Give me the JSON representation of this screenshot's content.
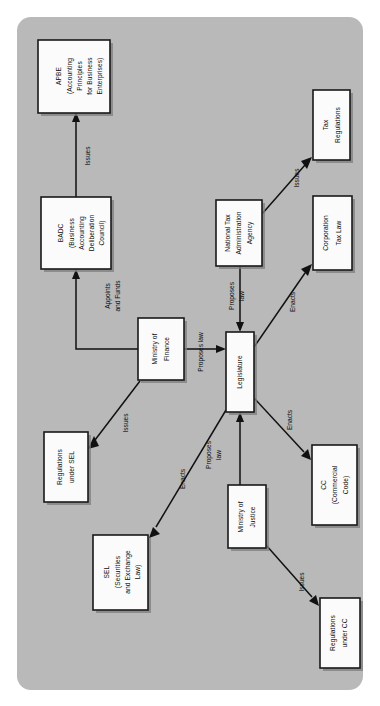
{
  "figure": {
    "kind": "flow-diagram",
    "orientation": "rotated-90-ccw",
    "panel_color": "#b9b9b9",
    "page_background": "#ffffff",
    "node_fill": "#fbfbfb",
    "node_stroke": "#1a1a1a",
    "edge_color": "#111111"
  },
  "nodes": [
    {
      "id": "apbe",
      "lines": [
        "APBE",
        "(Accounting",
        "Principles",
        "for Business",
        "Enterprises)"
      ],
      "x": 38,
      "y": 40,
      "w": 72,
      "h": 73
    },
    {
      "id": "badc",
      "lines": [
        "BADC",
        "(Business",
        "Accounting",
        "Deliberation",
        "Council)"
      ],
      "x": 41,
      "y": 197,
      "w": 70,
      "h": 72
    },
    {
      "id": "ministry-of-finance",
      "lines": [
        "Ministry of",
        "Finance"
      ],
      "x": 138,
      "y": 318,
      "w": 46,
      "h": 62
    },
    {
      "id": "regulations-under-sel",
      "lines": [
        "Regulations",
        "under SEL"
      ],
      "x": 44,
      "y": 432,
      "w": 44,
      "h": 70
    },
    {
      "id": "sel",
      "lines": [
        "SEL",
        "(Securities",
        "and Exchange",
        "Law)"
      ],
      "x": 93,
      "y": 535,
      "w": 55,
      "h": 75
    },
    {
      "id": "national-tax-administration-agency",
      "lines": [
        "National Tax",
        "Administration",
        "Agency"
      ],
      "x": 216,
      "y": 200,
      "w": 46,
      "h": 66
    },
    {
      "id": "legislature",
      "lines": [
        "Legislature"
      ],
      "x": 226,
      "y": 332,
      "w": 28,
      "h": 80
    },
    {
      "id": "tax-regulations",
      "lines": [
        "Tax",
        "Regulations"
      ],
      "x": 313,
      "y": 90,
      "w": 37,
      "h": 70
    },
    {
      "id": "corporation-tax-law",
      "lines": [
        "Corporation",
        "Tax Law"
      ],
      "x": 313,
      "y": 196,
      "w": 39,
      "h": 74
    },
    {
      "id": "cc",
      "lines": [
        "CC",
        "(Commercial",
        "Code)"
      ],
      "x": 312,
      "y": 445,
      "w": 45,
      "h": 80
    },
    {
      "id": "ministry-of-justice",
      "lines": [
        "Ministry of",
        "Justice"
      ],
      "x": 228,
      "y": 485,
      "w": 38,
      "h": 63
    },
    {
      "id": "regulations-under-cc",
      "lines": [
        "Regulations",
        "under CC"
      ],
      "x": 320,
      "y": 598,
      "w": 40,
      "h": 70
    }
  ],
  "edges": [
    {
      "id": "badc-to-apbe",
      "from": "badc",
      "to": "apbe",
      "label": "Issues",
      "label_x": 88,
      "label_y": 156
    },
    {
      "id": "mof-to-badc",
      "from": "ministry-of-finance",
      "to": "badc",
      "label": "Appoints\nand Funds",
      "label_x": 113,
      "label_y": 290
    },
    {
      "id": "mof-to-legislature",
      "from": "ministry-of-finance",
      "to": "legislature",
      "label": "Proposes law",
      "label_x": 204,
      "label_y": 349
    },
    {
      "id": "mof-to-regulations-under-sel",
      "from": "ministry-of-finance",
      "to": "regulations-under-sel",
      "label": "Issues",
      "label_x": 119,
      "label_y": 417
    },
    {
      "id": "legislature-to-sel",
      "from": "legislature",
      "to": "sel",
      "label": "Enacts",
      "label_x": 174,
      "label_y": 474
    },
    {
      "id": "ntaa-to-legislature",
      "from": "national-tax-administration-agency",
      "to": "legislature",
      "label": "Proposes\nlaw",
      "label_x": 248,
      "label_y": 293
    },
    {
      "id": "ntaa-to-tax-regulations",
      "from": "national-tax-administration-agency",
      "to": "tax-regulations",
      "label": "Issues",
      "label_x": 291,
      "label_y": 172
    },
    {
      "id": "legislature-to-corporation-tax-law",
      "from": "legislature",
      "to": "corporation-tax-law",
      "label": "Enacts",
      "label_x": 288,
      "label_y": 300
    },
    {
      "id": "legislature-to-cc",
      "from": "legislature",
      "to": "cc",
      "label": "Enacts",
      "label_x": 283,
      "label_y": 415
    },
    {
      "id": "moj-to-legislature",
      "from": "ministry-of-justice",
      "to": "legislature",
      "label": "Proposes\nlaw",
      "label_x": 214,
      "label_y": 455
    },
    {
      "id": "moj-to-regulations-under-cc",
      "from": "ministry-of-justice",
      "to": "regulations-under-cc",
      "label": "Issues",
      "label_x": 296,
      "label_y": 577
    }
  ]
}
